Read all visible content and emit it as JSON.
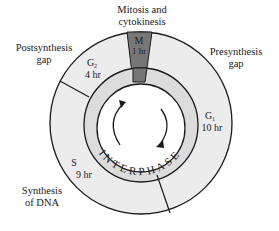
{
  "diagram": {
    "colors": {
      "ring_fill": "#ececec",
      "mitosis_fill": "#777777",
      "interphase_ring_fill": "#dcdcdc",
      "center_fill": "#ffffff",
      "stroke": "#1a1a1a"
    },
    "outer_labels": {
      "mitosis": [
        "Mitosis and",
        "cytokinesis"
      ],
      "postsynthesis": [
        "Postsynthesis",
        "gap"
      ],
      "presynthesis": [
        "Presynthesis",
        "gap"
      ],
      "synthesis": [
        "Synthesis",
        "of DNA"
      ]
    },
    "phases": [
      {
        "name": "M",
        "duration": "1 hr"
      },
      {
        "name": "G",
        "subscript": "1",
        "duration": "10 hr"
      },
      {
        "name": "S",
        "duration": "9 hr"
      },
      {
        "name": "G",
        "subscript": "2",
        "duration": "4 hr"
      }
    ],
    "interphase_label": "INTERPHASE",
    "center_icons": [
      "cycle-arrow-left-icon",
      "cycle-arrow-right-icon"
    ]
  }
}
